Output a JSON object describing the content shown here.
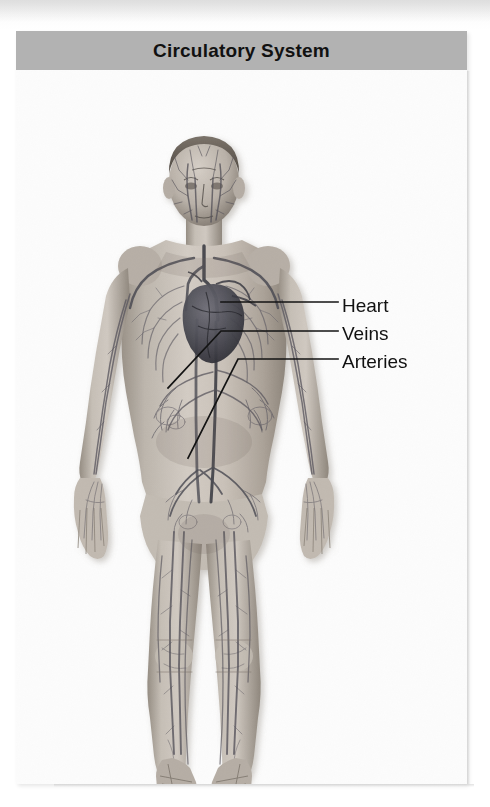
{
  "figure": {
    "title": "Circulatory System",
    "title_bar_color": "#b2b2b2",
    "panel_background": "#fbfbfb",
    "page_background": "#fdfdfd"
  },
  "labels": [
    {
      "id": "heart",
      "text": "Heart"
    },
    {
      "id": "veins",
      "text": "Veins"
    },
    {
      "id": "arteries",
      "text": "Arteries"
    }
  ],
  "leader_lines": {
    "heart": "horizontal from label left edge to the heart in the central chest",
    "veins": "horizontal then diagonal down-left to the venous network in the left abdomen",
    "arteries": "horizontal then diagonal down-left to the arterial branch in the lower abdomen"
  },
  "colors": {
    "skin_light": "#cfc8c0",
    "skin_mid": "#b2aaa1",
    "skin_shadow": "#8e867d",
    "vessel_dark": "#4a4a50",
    "vessel_mid": "#6a6a72",
    "heart_dark": "#3c3c42",
    "label_text": "#111111",
    "leader_line": "#1a1a1a"
  }
}
